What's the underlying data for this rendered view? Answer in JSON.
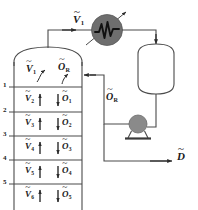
{
  "figure": {
    "type": "process-flow-diagram",
    "width": 198,
    "height": 210
  },
  "colors": {
    "line": "#4a4a4a",
    "line_dark": "#2b2b2b",
    "text": "#1a1a1a",
    "equipment_fill": "#ffffff",
    "condenser_fill": "#6e6e6e",
    "pump_fill": "#8a8a8a",
    "background": "#ffffff"
  },
  "column": {
    "name": "distillation-column",
    "stage_numbers": [
      "1",
      "2",
      "3",
      "4",
      "5"
    ],
    "top_section": {
      "vapor_label": {
        "symbol": "V",
        "sub": "1",
        "overline": "~"
      },
      "reflux_label": {
        "symbol": "O",
        "sub": "R",
        "overline": "~"
      }
    },
    "trays": [
      {
        "stage": "1",
        "vapor": {
          "symbol": "V",
          "sub": "2",
          "overline": "~"
        },
        "liquid": {
          "symbol": "O",
          "sub": "1",
          "overline": "~"
        }
      },
      {
        "stage": "2",
        "vapor": {
          "symbol": "V",
          "sub": "3",
          "overline": "~"
        },
        "liquid": {
          "symbol": "O",
          "sub": "2",
          "overline": "~"
        }
      },
      {
        "stage": "3",
        "vapor": {
          "symbol": "V",
          "sub": "4",
          "overline": "~"
        },
        "liquid": {
          "symbol": "O",
          "sub": "3",
          "overline": "~"
        }
      },
      {
        "stage": "4",
        "vapor": {
          "symbol": "V",
          "sub": "5",
          "overline": "~"
        },
        "liquid": {
          "symbol": "O",
          "sub": "4",
          "overline": "~"
        }
      },
      {
        "stage": "5",
        "vapor": {
          "symbol": "V",
          "sub": "6",
          "overline": "~"
        },
        "liquid": {
          "symbol": "O",
          "sub": "5",
          "overline": "~"
        }
      }
    ]
  },
  "streams": {
    "overhead_vapor": {
      "label_symbol": "V",
      "label_sub": "1",
      "overline": "~",
      "name": "overhead-vapour-stream"
    },
    "reflux": {
      "label_symbol": "O",
      "label_sub": "R",
      "overline": "~",
      "name": "reflux-stream"
    },
    "distillate": {
      "label_symbol": "D",
      "label_sub": "",
      "overline": "~",
      "name": "distillate-stream"
    }
  },
  "equipment": {
    "condenser": {
      "name": "condenser",
      "symbol": "heat-exchanger-zigzag"
    },
    "reflux_drum": {
      "name": "reflux-drum",
      "symbol": "vertical-vessel"
    },
    "pump": {
      "name": "pump",
      "symbol": "centrifugal-pump"
    }
  },
  "labels": {
    "V1_top": "V",
    "V1_top_sub": "1",
    "V1_col": "V",
    "V1_col_sub": "1",
    "OR_col": "O",
    "OR_col_sub": "R",
    "OR_mid": "O",
    "OR_mid_sub": "R",
    "D": "D",
    "V2": "V",
    "V2_sub": "2",
    "O1": "O",
    "O1_sub": "1",
    "V3": "V",
    "V3_sub": "3",
    "O2": "O",
    "O2_sub": "2",
    "V4": "V",
    "V4_sub": "4",
    "O3": "O",
    "O3_sub": "3",
    "V5": "V",
    "V5_sub": "5",
    "O4": "O",
    "O4_sub": "4",
    "V6": "V",
    "V6_sub": "6",
    "O5": "O",
    "O5_sub": "5",
    "n1": "1",
    "n2": "2",
    "n3": "3",
    "n4": "4",
    "n5": "5"
  }
}
